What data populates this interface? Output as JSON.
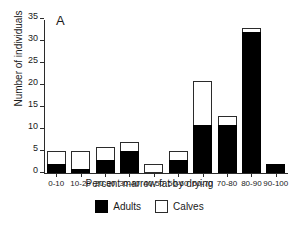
{
  "panel": {
    "label": "A"
  },
  "chart_data": {
    "type": "bar",
    "stacked": true,
    "title": "",
    "subtitle": "",
    "xlabel": "Percent marrow fat by drying",
    "ylabel": "Number of individuals",
    "categories": [
      "0-10",
      "10-20",
      "20-30",
      "30-40",
      "40-50",
      "50-60",
      "60-70",
      "70-80",
      "80-90",
      "90-100"
    ],
    "series": [
      {
        "name": "Adults",
        "color": "#000000",
        "fill": "solid-black",
        "values": [
          2,
          1,
          3,
          5,
          0,
          3,
          11,
          11,
          32,
          2
        ]
      },
      {
        "name": "Calves",
        "color": "#ffffff",
        "fill": "open-white",
        "values": [
          3,
          4,
          3,
          2,
          2,
          2,
          10,
          2,
          1,
          0
        ]
      }
    ],
    "totals": [
      5,
      5,
      6,
      7,
      2,
      5,
      21,
      13,
      33,
      2
    ],
    "ylim": [
      0,
      35
    ],
    "yticks": [
      0,
      5,
      10,
      15,
      20,
      25,
      30,
      35
    ],
    "ytick_labels": [
      "0",
      "5",
      "10",
      "15",
      "20",
      "25",
      "30",
      "35"
    ],
    "grid": false,
    "legend_position": "bottom-center",
    "axis_color": "#2b2b2b"
  },
  "legend": {
    "entries": [
      {
        "label": "Adults"
      },
      {
        "label": "Calves"
      }
    ]
  }
}
